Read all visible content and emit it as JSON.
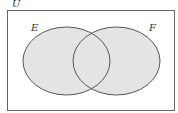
{
  "diagram": {
    "type": "venn",
    "universe_label": "U",
    "sets": [
      {
        "label": "E",
        "cx": 66.5,
        "cy": 61,
        "rx": 43.5,
        "ry": 34
      },
      {
        "label": "F",
        "cx": 116.5,
        "cy": 61,
        "rx": 43.5,
        "ry": 34
      }
    ],
    "shaded_region": "E ∪ F",
    "colors": {
      "fill": "#e4e4e4",
      "stroke": "#555555",
      "frame": "#666666"
    }
  }
}
